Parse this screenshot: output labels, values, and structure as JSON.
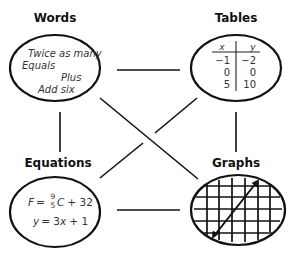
{
  "diagram": {
    "nodes": {
      "words": {
        "title": "Words",
        "lines": [
          "Twice as many",
          "Equals",
          "Plus",
          "Add six"
        ]
      },
      "tables": {
        "title": "Tables",
        "headers": [
          "x",
          "y"
        ],
        "rows": [
          [
            "−1",
            "−2"
          ],
          [
            "0",
            "0"
          ],
          [
            "5",
            "10"
          ]
        ]
      },
      "equations": {
        "title": "Equations",
        "eq1": {
          "lhs": "F",
          "eq": "=",
          "frac_num": "9",
          "frac_den": "5",
          "var": "C",
          "rest": "+ 32"
        },
        "eq2": {
          "lhs": "y",
          "eq": "= 3",
          "var": "x",
          "rest": "+ 1"
        }
      },
      "graphs": {
        "title": "Graphs",
        "content": "grid with line"
      }
    },
    "connections": [
      [
        "words",
        "tables"
      ],
      [
        "words",
        "equations"
      ],
      [
        "words",
        "graphs"
      ],
      [
        "tables",
        "equations"
      ],
      [
        "tables",
        "graphs"
      ],
      [
        "equations",
        "graphs"
      ]
    ],
    "colors": {
      "stroke": "#111111",
      "text": "#333333"
    }
  }
}
